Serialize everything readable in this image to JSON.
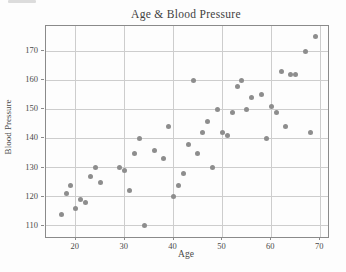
{
  "figure": {
    "title": "Age & Blood Pressure",
    "xlabel": "Age",
    "ylabel": "Blood Pressure"
  },
  "chart_data": {
    "type": "scatter",
    "title": "Age & Blood Pressure",
    "xlabel": "Age",
    "ylabel": "Blood Pressure",
    "x_ticks": [
      20,
      30,
      40,
      50,
      60,
      70
    ],
    "y_ticks": [
      110,
      120,
      130,
      140,
      150,
      160,
      170
    ],
    "xlim": [
      13.9,
      71.6
    ],
    "ylim": [
      106.2,
      178.6
    ],
    "grid": true,
    "legend": null,
    "colors": {
      "point": "#8d8d8d",
      "grid": "#cdcdcd",
      "axis": "#8a8a8a",
      "text": "#4a4a4a",
      "background": "#fdfdfd"
    },
    "points": [
      [
        17,
        114
      ],
      [
        18,
        121
      ],
      [
        19,
        124
      ],
      [
        20,
        116
      ],
      [
        21,
        119
      ],
      [
        22,
        118
      ],
      [
        23,
        127
      ],
      [
        24,
        130
      ],
      [
        25,
        125
      ],
      [
        29,
        130
      ],
      [
        30,
        129
      ],
      [
        31,
        122
      ],
      [
        32,
        135
      ],
      [
        33,
        140
      ],
      [
        34,
        110
      ],
      [
        36,
        136
      ],
      [
        38,
        133
      ],
      [
        39,
        144
      ],
      [
        40,
        120
      ],
      [
        41,
        124
      ],
      [
        42,
        128
      ],
      [
        43,
        138
      ],
      [
        44,
        160
      ],
      [
        45,
        135
      ],
      [
        46,
        142
      ],
      [
        47,
        146
      ],
      [
        48,
        130
      ],
      [
        49,
        150
      ],
      [
        50,
        142
      ],
      [
        51,
        141
      ],
      [
        52,
        149
      ],
      [
        53,
        158
      ],
      [
        54,
        160
      ],
      [
        55,
        150
      ],
      [
        56,
        154
      ],
      [
        58,
        155
      ],
      [
        59,
        140
      ],
      [
        60,
        151
      ],
      [
        61,
        149
      ],
      [
        62,
        163
      ],
      [
        63,
        144
      ],
      [
        64,
        162
      ],
      [
        65,
        162
      ],
      [
        67,
        170
      ],
      [
        68,
        142
      ],
      [
        69,
        175
      ]
    ]
  }
}
